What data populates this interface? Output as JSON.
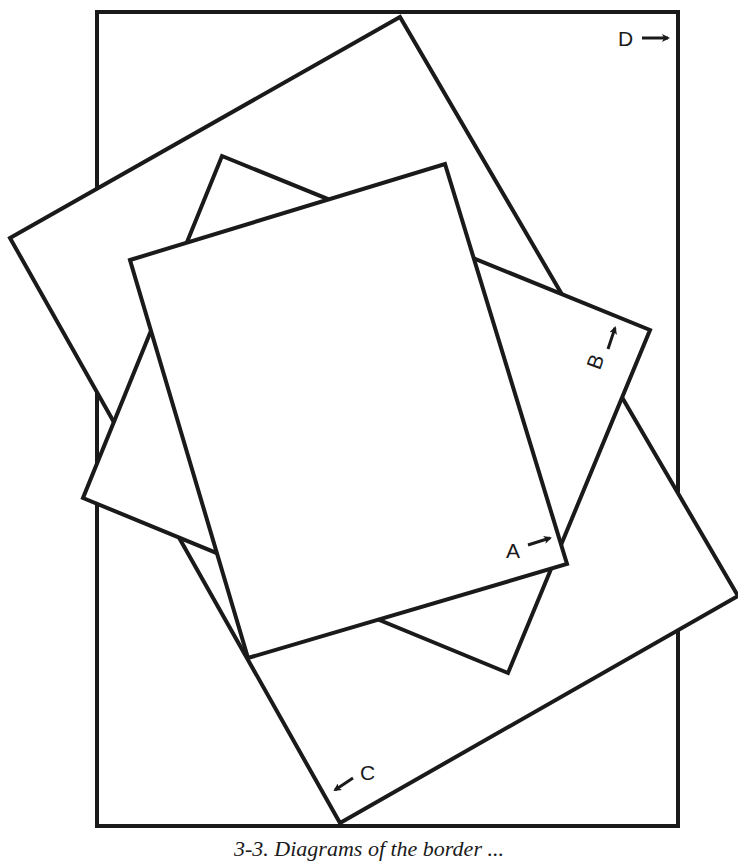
{
  "diagram": {
    "stroke_color": "#1a1a1a",
    "background": "#ffffff",
    "shapes": [
      {
        "id": "D",
        "name": "outer-rectangle-d",
        "points": "97,12 678,12 678,826 97,826"
      },
      {
        "id": "C",
        "name": "rotated-rectangle-c",
        "points": "10,238 400,17 738,596 340,823"
      },
      {
        "id": "B",
        "name": "rotated-rectangle-b",
        "points": "222,156 650,330 508,673 83,498"
      },
      {
        "id": "A",
        "name": "rotated-rectangle-a",
        "points": "130,260 445,164 567,564 248,658"
      }
    ],
    "labels": {
      "a": "A",
      "b": "B",
      "c": "C",
      "d": "D"
    }
  },
  "caption": "3-3. Diagrams of the border ..."
}
